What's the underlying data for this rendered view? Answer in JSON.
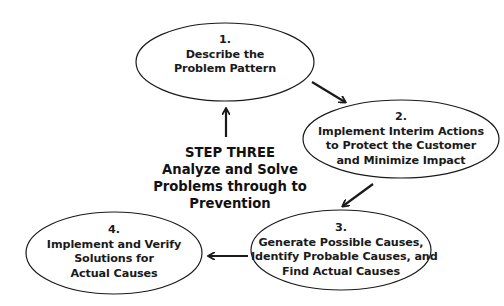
{
  "diagram": {
    "center": {
      "title": "STEP THREE",
      "lines": [
        "Analyze and Solve",
        "Problems through to",
        "Prevention"
      ]
    },
    "nodes": [
      {
        "number": "1.",
        "lines": [
          "Describe the",
          "Problem Pattern"
        ]
      },
      {
        "number": "2.",
        "lines": [
          "Implement Interim Actions",
          "to Protect the Customer",
          "and Minimize Impact"
        ]
      },
      {
        "number": "3.",
        "lines": [
          "Generate Possible Causes,",
          "Identify Probable Causes, and",
          "Find Actual Causes"
        ]
      },
      {
        "number": "4.",
        "lines": [
          "Implement and Verify",
          "Solutions for",
          "Actual Causes"
        ]
      }
    ],
    "flow": [
      "1 -> 2",
      "2 -> 3",
      "3 -> 4",
      "4 -> 1"
    ],
    "colors": {
      "stroke": "#1a1a1a",
      "background": "#ffffff",
      "text": "#111111"
    }
  }
}
